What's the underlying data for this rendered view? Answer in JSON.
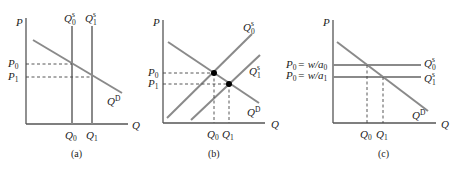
{
  "figure": {
    "panels": [
      {
        "id": "a",
        "caption": "(a)",
        "axes": {
          "y": "P",
          "x": "Q"
        },
        "price_labels": [
          {
            "base": "P",
            "sub": "0"
          },
          {
            "base": "P",
            "sub": "1"
          }
        ],
        "quantity_labels": [
          {
            "base": "Q",
            "sub": "0"
          },
          {
            "base": "Q",
            "sub": "1"
          }
        ],
        "supply_labels": [
          {
            "base": "Q",
            "sub": "0",
            "sup": "s"
          },
          {
            "base": "Q",
            "sub": "1",
            "sup": "s"
          }
        ],
        "demand_label": {
          "base": "Q",
          "sup": "D"
        },
        "supply_shape": "vertical"
      },
      {
        "id": "b",
        "caption": "(b)",
        "axes": {
          "y": "P",
          "x": "Q"
        },
        "price_labels": [
          {
            "base": "P",
            "sub": "0"
          },
          {
            "base": "P",
            "sub": "1"
          }
        ],
        "quantity_labels": [
          {
            "base": "Q",
            "sub": "0"
          },
          {
            "base": "Q",
            "sub": "1"
          }
        ],
        "supply_labels": [
          {
            "base": "Q",
            "sub": "0",
            "sup": "s"
          },
          {
            "base": "Q",
            "sub": "1",
            "sup": "s"
          }
        ],
        "demand_label": {
          "base": "Q",
          "sup": "D"
        },
        "supply_shape": "upward-sloping",
        "equilibrium_points": 2
      },
      {
        "id": "c",
        "caption": "(c)",
        "axes": {
          "y": "P",
          "x": "Q"
        },
        "price_labels": [
          {
            "text": "P",
            "sub": "0",
            "rhs": "= w/a",
            "rhs_sub": "0"
          },
          {
            "text": "P",
            "sub": "0",
            "rhs": "= w/a",
            "rhs_sub": "1"
          }
        ],
        "quantity_labels": [
          {
            "base": "Q",
            "sub": "0"
          },
          {
            "base": "Q",
            "sub": "1"
          }
        ],
        "supply_labels": [
          {
            "base": "Q",
            "sub": "0",
            "sup": "s"
          },
          {
            "base": "Q",
            "sub": "1",
            "sup": "s"
          }
        ],
        "demand_label": {
          "base": "Q",
          "sup": "D"
        },
        "supply_shape": "horizontal"
      }
    ]
  }
}
